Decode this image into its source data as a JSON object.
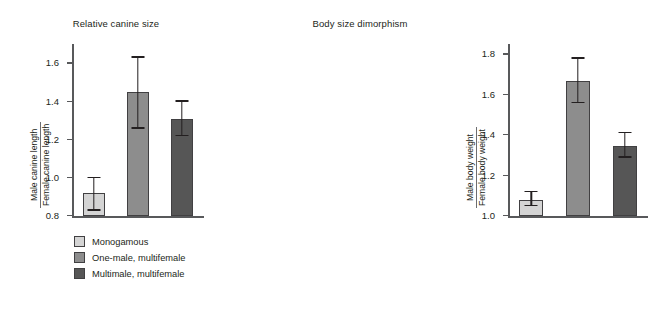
{
  "chart_data": [
    {
      "type": "bar",
      "title": "Relative canine size",
      "xlabel": "",
      "ylabel_numerator": "Male canine length",
      "ylabel_denominator": "Female canine length",
      "ylim": [
        0.8,
        1.7
      ],
      "yticks": [
        0.8,
        1.0,
        1.2,
        1.4,
        1.6
      ],
      "ytick_labels": [
        "0.8",
        "1.0",
        "1.2",
        "1.4",
        "1.6"
      ],
      "grid": false,
      "legend_position": "below",
      "categories": [
        "Monogamous",
        "One-male, multifemale",
        "Multimale, multifemale"
      ],
      "values": [
        0.92,
        1.45,
        1.31
      ],
      "error_low": [
        0.83,
        1.26,
        1.22
      ],
      "error_high": [
        1.0,
        1.63,
        1.4
      ],
      "colors": [
        "#d4d4d4",
        "#8d8d8d",
        "#565656"
      ]
    },
    {
      "type": "bar",
      "title": "Body size dimorphism",
      "xlabel": "",
      "ylabel_numerator": "Male body weight",
      "ylabel_denominator": "Female body weight",
      "ylim": [
        1.0,
        1.85
      ],
      "yticks": [
        1.0,
        1.2,
        1.4,
        1.6,
        1.8
      ],
      "ytick_labels": [
        "1.0",
        "1.2",
        "1.4",
        "1.6",
        "1.8"
      ],
      "grid": false,
      "legend_position": "below",
      "categories": [
        "Monogamous",
        "One-male, multifemale",
        "Multimale, multifemale"
      ],
      "values": [
        1.08,
        1.67,
        1.35
      ],
      "error_low": [
        1.05,
        1.56,
        1.29
      ],
      "error_high": [
        1.12,
        1.78,
        1.41
      ],
      "colors": [
        "#d4d4d4",
        "#8d8d8d",
        "#565656"
      ]
    }
  ],
  "legend": {
    "items": [
      {
        "label": "Monogamous",
        "color": "#d4d4d4"
      },
      {
        "label": "One-male, multifemale",
        "color": "#8d8d8d"
      },
      {
        "label": "Multimale, multifemale",
        "color": "#565656"
      }
    ]
  },
  "left": {
    "title": "Relative canine size",
    "ylabel_num": "Male canine length",
    "ylabel_den": "Female canine length",
    "ytick_labels": [
      "1.6",
      "1.4",
      "1.2",
      "1.0",
      "0.8"
    ]
  },
  "right": {
    "title": "Body size dimorphism",
    "ylabel_num": "Male body weight",
    "ylabel_den": "Female body weight",
    "ytick_labels": [
      "1.8",
      "1.6",
      "1.4",
      "1.2",
      "1.0"
    ]
  }
}
